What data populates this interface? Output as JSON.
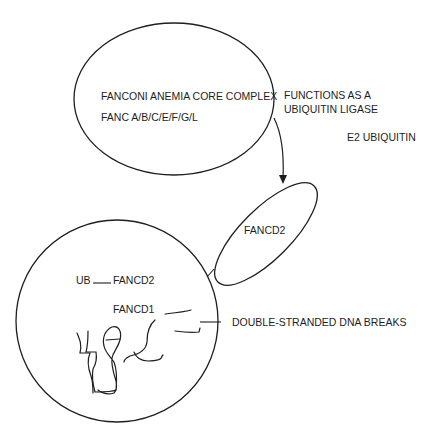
{
  "diagram": {
    "core_complex": {
      "title": "FANCONI ANEMIA CORE COMPLEX",
      "members": "FANC A/B/C/E/F/G/L"
    },
    "function_note": {
      "line1": "FUNCTIONS AS A",
      "line2": "UBIQUITIN LIGASE"
    },
    "e2_label": "E2 UBIQUITIN",
    "fancd2_ellipse_label": "FANCD2",
    "nucleus": {
      "ub_label": "UB",
      "ub_fancd2_label": "FANCD2",
      "fancd1_label": "FANCD1"
    },
    "dna_breaks_label": "DOUBLE-STRANDED DNA BREAKS",
    "colors": {
      "stroke": "#1e1e1e",
      "background": "#ffffff"
    }
  }
}
